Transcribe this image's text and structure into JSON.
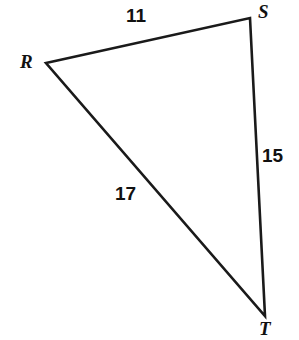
{
  "figure": {
    "kind": "geometry-diagram",
    "shape": "triangle",
    "name": "Triangle RST",
    "background_color": "#ffffff",
    "stroke_color": "#1a1a1a",
    "stroke_width": 2.6,
    "canvas": {
      "width": 299,
      "height": 340
    }
  },
  "vertices": [
    {
      "id": "R",
      "label": "R",
      "x": 46,
      "y": 63,
      "label_x": 20,
      "label_y": 52
    },
    {
      "id": "S",
      "label": "S",
      "x": 250,
      "y": 18,
      "label_x": 258,
      "label_y": 2
    },
    {
      "id": "T",
      "label": "T",
      "x": 265,
      "y": 316,
      "label_x": 259,
      "label_y": 319
    }
  ],
  "sides": [
    {
      "id": "RS",
      "from": "R",
      "to": "S",
      "length_label": "11",
      "label_x": 126,
      "label_y": 6
    },
    {
      "id": "ST",
      "from": "S",
      "to": "T",
      "length_label": "15",
      "label_x": 262,
      "label_y": 146
    },
    {
      "id": "RT",
      "from": "R",
      "to": "T",
      "length_label": "17",
      "label_x": 115,
      "label_y": 184
    }
  ],
  "chart_data": {
    "type": "diagram",
    "vertex_labels": [
      "R",
      "S",
      "T"
    ],
    "side_labels": [
      "11",
      "15",
      "17"
    ],
    "points": {
      "R": [
        46,
        63
      ],
      "S": [
        250,
        18
      ],
      "T": [
        265,
        316
      ]
    },
    "edges": [
      {
        "edge": "RS",
        "value": 11
      },
      {
        "edge": "ST",
        "value": 15
      },
      {
        "edge": "RT",
        "value": 17
      }
    ]
  }
}
